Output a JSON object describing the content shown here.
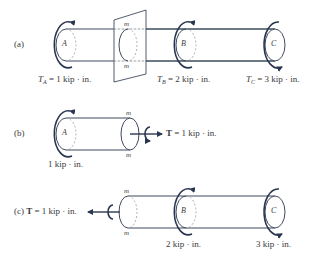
{
  "figures": [
    {
      "id": "a",
      "panel_label": "(a)",
      "section_marks": [
        "m",
        "m"
      ],
      "disks": [
        {
          "name": "A",
          "torque_symbol": "T",
          "torque_sub": "A",
          "torque_text": "= 1 kip · in."
        },
        {
          "name": "B",
          "torque_symbol": "T",
          "torque_sub": "B",
          "torque_text": "= 2 kip · in."
        },
        {
          "name": "C",
          "torque_symbol": "T",
          "torque_sub": "C",
          "torque_text": "= 3 kip · in."
        }
      ]
    },
    {
      "id": "b",
      "panel_label": "(b)",
      "section_marks": [
        "m",
        "m"
      ],
      "disk": {
        "name": "A",
        "torque_text": "1 kip · in."
      },
      "internal_torque": {
        "symbol": "T",
        "text": "= 1 kip · in."
      }
    },
    {
      "id": "c",
      "panel_label": "(c)",
      "section_marks": [
        "m",
        "m"
      ],
      "internal_torque": {
        "symbol": "T",
        "text": "= 1 kip · in."
      },
      "disks": [
        {
          "name": "B",
          "torque_text": "2 kip · in."
        },
        {
          "name": "C",
          "torque_text": "3 kip · in."
        }
      ]
    }
  ],
  "colors": {
    "line": "#3f4a5c",
    "arrow": "#2a3650",
    "dashed": "#9a9a9a",
    "text": "#3a3a3a"
  }
}
